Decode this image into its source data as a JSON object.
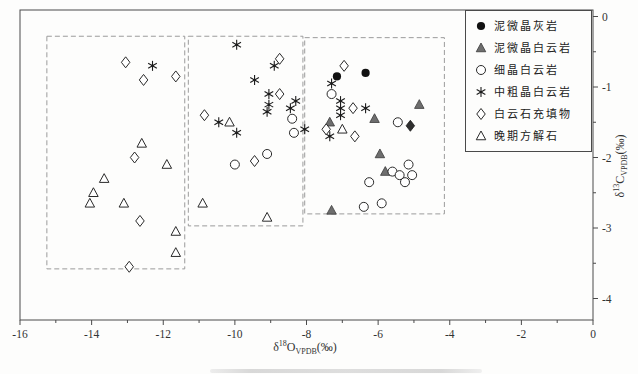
{
  "figure": {
    "background_color": "#fdfdfc",
    "frame_color": "#4a4a4a",
    "dashed_box_color": "#9b9b9b"
  },
  "legend": {
    "items": [
      {
        "marker": "circle-filled",
        "label": "泥微晶灰岩"
      },
      {
        "marker": "triangle-filled",
        "label": "泥微晶白云岩"
      },
      {
        "marker": "circle-open",
        "label": "细晶白云岩"
      },
      {
        "marker": "asterisk",
        "label": "中粗晶白云岩"
      },
      {
        "marker": "diamond-open",
        "label": "白云石充填物"
      },
      {
        "marker": "triangle-open",
        "label": "晚期方解石"
      }
    ]
  },
  "axes": {
    "x": {
      "delta": "δ",
      "isotope": "18",
      "element": "O",
      "standard": "VPDB",
      "unit": "(‰)"
    },
    "y": {
      "delta": "δ",
      "isotope": "13",
      "element": "C",
      "standard": "VPDB",
      "unit": "(‰)"
    }
  },
  "chart_data": {
    "type": "scatter",
    "title": "",
    "xlabel": "δ18O VPDB (‰)",
    "ylabel": "δ13C VPDB (‰)",
    "xlim": [
      -16,
      0
    ],
    "ylim": [
      0.1,
      -4.3
    ],
    "grid": false,
    "legend_position": "top-right-inside",
    "x_ticks": {
      "values": [
        -16,
        -14,
        -12,
        -10,
        -8,
        -6,
        -4,
        -2,
        0
      ],
      "labels": [
        "-16",
        "-14",
        "-12",
        "-10",
        "-8",
        "-6",
        "-4",
        "-2",
        "0"
      ],
      "minor_step": 1
    },
    "y_ticks": {
      "values": [
        0,
        -1,
        -2,
        -3,
        -4
      ],
      "labels": [
        "0",
        "-1",
        "-2",
        "-3",
        "-4"
      ],
      "minor_step": 0.5
    },
    "cluster_boxes": [
      {
        "x1": -15.25,
        "x2": -11.4,
        "y1": -0.28,
        "y2": -3.58
      },
      {
        "x1": -11.3,
        "x2": -8.1,
        "y1": -0.28,
        "y2": -2.97
      },
      {
        "x1": -8.05,
        "x2": -4.15,
        "y1": -0.3,
        "y2": -2.8
      }
    ],
    "series": [
      {
        "name": "泥微晶灰岩",
        "marker": "circle-filled",
        "points": [
          [
            -7.15,
            -0.85
          ],
          [
            -6.35,
            -0.8
          ]
        ]
      },
      {
        "name": "泥微晶白云岩",
        "marker": "triangle-filled",
        "points": [
          [
            -7.35,
            -1.5
          ],
          [
            -6.1,
            -1.45
          ],
          [
            -4.85,
            -1.25
          ],
          [
            -5.95,
            -1.95
          ],
          [
            -5.8,
            -2.2
          ],
          [
            -7.3,
            -2.75
          ]
        ]
      },
      {
        "name": "",
        "marker": "diamond-filled",
        "points": [
          [
            -5.1,
            -1.55
          ]
        ]
      },
      {
        "name": "细晶白云岩",
        "marker": "circle-open",
        "points": [
          [
            -7.3,
            -1.1
          ],
          [
            -8.4,
            -1.45
          ],
          [
            -8.35,
            -1.65
          ],
          [
            -9.1,
            -1.95
          ],
          [
            -10.0,
            -2.1
          ],
          [
            -5.45,
            -1.5
          ],
          [
            -5.6,
            -2.2
          ],
          [
            -5.4,
            -2.25
          ],
          [
            -5.15,
            -2.1
          ],
          [
            -5.05,
            -2.25
          ],
          [
            -5.25,
            -2.35
          ],
          [
            -6.25,
            -2.35
          ],
          [
            -5.9,
            -2.65
          ],
          [
            -6.4,
            -2.7
          ]
        ]
      },
      {
        "name": "中粗晶白云岩",
        "marker": "asterisk",
        "points": [
          [
            -12.3,
            -0.7
          ],
          [
            -9.95,
            -0.4
          ],
          [
            -8.9,
            -0.7
          ],
          [
            -9.45,
            -0.9
          ],
          [
            -9.05,
            -1.1
          ],
          [
            -9.05,
            -1.25
          ],
          [
            -9.1,
            -1.35
          ],
          [
            -8.3,
            -1.2
          ],
          [
            -8.45,
            -1.3
          ],
          [
            -10.45,
            -1.5
          ],
          [
            -9.95,
            -1.65
          ],
          [
            -8.05,
            -1.6
          ],
          [
            -7.3,
            -0.95
          ],
          [
            -7.05,
            -1.2
          ],
          [
            -7.05,
            -1.3
          ],
          [
            -7.05,
            -1.4
          ],
          [
            -6.35,
            -1.3
          ],
          [
            -7.35,
            -1.7
          ]
        ]
      },
      {
        "name": "白云石充填物",
        "marker": "diamond-open",
        "points": [
          [
            -13.05,
            -0.65
          ],
          [
            -12.55,
            -0.9
          ],
          [
            -11.65,
            -0.85
          ],
          [
            -12.8,
            -2.0
          ],
          [
            -12.65,
            -2.9
          ],
          [
            -12.95,
            -3.55
          ],
          [
            -8.75,
            -0.6
          ],
          [
            -8.75,
            -1.1
          ],
          [
            -10.85,
            -1.4
          ],
          [
            -9.45,
            -2.05
          ],
          [
            -6.95,
            -0.7
          ],
          [
            -6.7,
            -1.3
          ],
          [
            -7.45,
            -1.6
          ],
          [
            -6.65,
            -1.7
          ]
        ]
      },
      {
        "name": "晚期方解石",
        "marker": "triangle-open",
        "points": [
          [
            -12.6,
            -1.8
          ],
          [
            -11.9,
            -2.1
          ],
          [
            -13.65,
            -2.3
          ],
          [
            -13.95,
            -2.5
          ],
          [
            -14.05,
            -2.65
          ],
          [
            -13.1,
            -2.65
          ],
          [
            -11.65,
            -3.05
          ],
          [
            -11.65,
            -3.35
          ],
          [
            -10.15,
            -1.5
          ],
          [
            -10.9,
            -2.65
          ],
          [
            -9.1,
            -2.85
          ],
          [
            -7.0,
            -1.6
          ]
        ]
      }
    ]
  }
}
